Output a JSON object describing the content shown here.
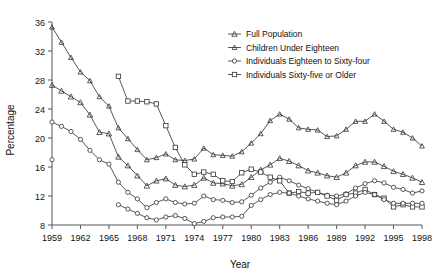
{
  "chart_data": {
    "type": "line",
    "title": "",
    "xlabel": "Year",
    "ylabel": "Percentage",
    "xlim": [
      1959,
      1998
    ],
    "ylim": [
      8,
      36
    ],
    "ytick_step": 4,
    "yticks": [
      8,
      12,
      16,
      20,
      24,
      28,
      32,
      36
    ],
    "xticks": [
      1959,
      1962,
      1965,
      1968,
      1971,
      1974,
      1977,
      1980,
      1983,
      1986,
      1989,
      1992,
      1995,
      1998
    ],
    "xtick_labels": [
      "1959",
      "1962",
      "1965",
      "1968",
      "1971",
      "1974",
      "1977",
      "1980",
      "1983",
      "1986",
      "1989",
      "1992",
      "1995",
      "1998"
    ],
    "grid": false,
    "legend_position": "top-right",
    "x": [
      1959,
      1960,
      1961,
      1962,
      1963,
      1964,
      1965,
      1966,
      1967,
      1968,
      1969,
      1970,
      1971,
      1972,
      1973,
      1974,
      1975,
      1976,
      1977,
      1978,
      1979,
      1980,
      1981,
      1982,
      1983,
      1984,
      1985,
      1986,
      1987,
      1988,
      1989,
      1990,
      1991,
      1992,
      1993,
      1994,
      1995,
      1996,
      1997,
      1998
    ],
    "series": [
      {
        "name": "Full Population",
        "marker": "triangle",
        "values": [
          27.3,
          26.5,
          25.7,
          24.9,
          23.2,
          20.8,
          20.6,
          17.4,
          16.2,
          14.8,
          13.4,
          14.1,
          14.4,
          13.5,
          13.3,
          13.5,
          14.5,
          13.8,
          13.7,
          13.4,
          13.6,
          14.6,
          15.6,
          16.3,
          17.2,
          16.8,
          16.2,
          15.5,
          15.2,
          14.8,
          14.6,
          15.2,
          16.2,
          16.7,
          16.7,
          16.1,
          15.4,
          15.0,
          14.5,
          13.9
        ]
      },
      {
        "name": "Children Under Eighteen",
        "marker": "triangle-small",
        "values": [
          35.3,
          33.2,
          31.1,
          29.1,
          27.9,
          25.7,
          24.4,
          21.4,
          19.9,
          18.4,
          17.0,
          17.3,
          17.8,
          17.0,
          16.9,
          17.1,
          18.6,
          17.7,
          17.6,
          17.5,
          18.1,
          19.3,
          20.6,
          22.4,
          23.3,
          22.6,
          21.4,
          21.2,
          21.1,
          20.2,
          20.3,
          21.2,
          22.3,
          22.3,
          23.3,
          22.3,
          21.2,
          20.8,
          20.0,
          18.9
        ]
      },
      {
        "name": "Individuals Eighteen to Sixty-four",
        "marker": "circle-open",
        "values": [
          22.2,
          21.6,
          20.9,
          19.8,
          18.3,
          17.0,
          16.4,
          13.9,
          12.5,
          11.6,
          10.4,
          11.1,
          11.6,
          11.1,
          10.9,
          11.0,
          12.0,
          11.5,
          11.4,
          11.1,
          11.2,
          12.1,
          13.1,
          13.9,
          14.6,
          14.1,
          13.5,
          13.0,
          12.5,
          12.1,
          12.0,
          12.3,
          13.1,
          13.7,
          14.1,
          13.8,
          13.2,
          12.9,
          12.4,
          12.7
        ]
      },
      {
        "name": "Individuals Sixty-five or Older",
        "marker": "square-open",
        "values": [
          null,
          null,
          null,
          null,
          null,
          null,
          null,
          28.5,
          25.1,
          25.1,
          25.0,
          24.7,
          21.7,
          18.7,
          16.3,
          15.0,
          15.3,
          15.0,
          14.1,
          14.0,
          15.2,
          15.7,
          15.3,
          14.6,
          14.1,
          12.4,
          12.6,
          12.4,
          12.5,
          12.0,
          11.4,
          12.2,
          12.4,
          12.9,
          12.2,
          11.7,
          10.5,
          10.8,
          10.5,
          10.5
        ]
      },
      {
        "name": "Individuals Sixty-five or Older (low)",
        "marker": "circle-open",
        "hidden_from_legend": true,
        "values": [
          17.0,
          null,
          null,
          null,
          null,
          null,
          null,
          10.8,
          10.2,
          9.6,
          9.0,
          8.7,
          9.1,
          9.3,
          8.9,
          8.2,
          8.5,
          9.0,
          9.1,
          9.1,
          9.2,
          10.7,
          11.5,
          12.2,
          12.5,
          12.4,
          12.0,
          11.6,
          11.3,
          11.0,
          10.8,
          11.3,
          12.0,
          12.5,
          12.2,
          11.5,
          11.0,
          11.0,
          11.0,
          11.0
        ]
      }
    ]
  },
  "legend": {
    "entries": [
      {
        "label": "Full Population"
      },
      {
        "label": "Children Under Eighteen"
      },
      {
        "label": "Individuals Eighteen to Sixty-four"
      },
      {
        "label": "Individuals Sixty-five or Older"
      }
    ]
  }
}
